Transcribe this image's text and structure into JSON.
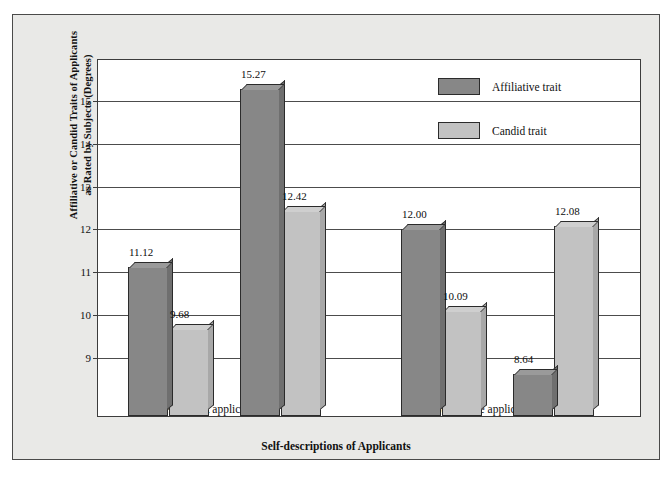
{
  "chart_data": {
    "type": "bar",
    "title": "",
    "xlabel": "Self-descriptions of Applicants",
    "ylabel": "Affiliative or Candid Traits of Applicants as Rated by Subjects (Degrees)",
    "ylabel_line1": "Affiliative or Candid Traits of Applicants",
    "ylabel_line2": "as Rated by Subjects (Degrees)",
    "ylim": [
      7.65,
      15.95
    ],
    "yticks": [
      9,
      10,
      11,
      12,
      13,
      14,
      15
    ],
    "ytick_labels": [
      "9",
      "10",
      "11",
      "12",
      "13",
      "14",
      "15"
    ],
    "grid": true,
    "legend_position": "top-right",
    "categories": [
      "In-role",
      "Out-of-role",
      "In-role",
      "Out-of-role"
    ],
    "groups": [
      {
        "name": "Astronaut applicants",
        "categories": [
          "In-role",
          "Out-of-role"
        ]
      },
      {
        "name": "Submarine applicants",
        "categories": [
          "In-role",
          "Out-of-role"
        ]
      }
    ],
    "series": [
      {
        "name": "Affiliative trait",
        "color": "#878787",
        "values": [
          11.12,
          15.27,
          12.0,
          8.64
        ],
        "value_labels": [
          "11.12",
          "15.27",
          "12.00",
          "8.64"
        ]
      },
      {
        "name": "Candid trait",
        "color": "#c2c2c2",
        "values": [
          9.68,
          12.42,
          10.09,
          12.08
        ],
        "value_labels": [
          "9.68",
          "12.42",
          "10.09",
          "12.08"
        ]
      }
    ]
  },
  "legend": {
    "items": [
      {
        "label": "Affiliative trait",
        "color": "#878787"
      },
      {
        "label": "Candid trait",
        "color": "#c2c2c2"
      }
    ]
  },
  "axis": {
    "y_title_line1": "Affiliative or Candid Traits of Applicants",
    "y_title_line2": "as Rated by Subjects (Degrees)",
    "x_title": "Self-descriptions of Applicants"
  }
}
